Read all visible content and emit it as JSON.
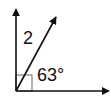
{
  "diagram": {
    "type": "angle-diagram",
    "labels": {
      "angle_name": "2",
      "angle_measure": "63°"
    },
    "right_angle_marker": true,
    "colors": {
      "stroke": "#111111",
      "background": "#ffffff"
    }
  }
}
